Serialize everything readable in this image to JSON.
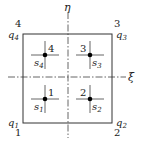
{
  "diagram": {
    "axes": {
      "xi": {
        "label": "ξ"
      },
      "eta": {
        "label": "η"
      }
    },
    "corners": [
      {
        "number": "1",
        "q_base": "q",
        "q_sub": "1"
      },
      {
        "number": "2",
        "q_base": "q",
        "q_sub": "2"
      },
      {
        "number": "3",
        "q_base": "q",
        "q_sub": "3"
      },
      {
        "number": "4",
        "q_base": "q",
        "q_sub": "4"
      }
    ],
    "sample_points": [
      {
        "number": "1",
        "s_base": "s",
        "s_sub": "1"
      },
      {
        "number": "2",
        "s_base": "s",
        "s_sub": "2"
      },
      {
        "number": "3",
        "s_base": "s",
        "s_sub": "3"
      },
      {
        "number": "4",
        "s_base": "s",
        "s_sub": "4"
      }
    ],
    "colors": {
      "line": "#333333",
      "point": "#000000"
    }
  }
}
